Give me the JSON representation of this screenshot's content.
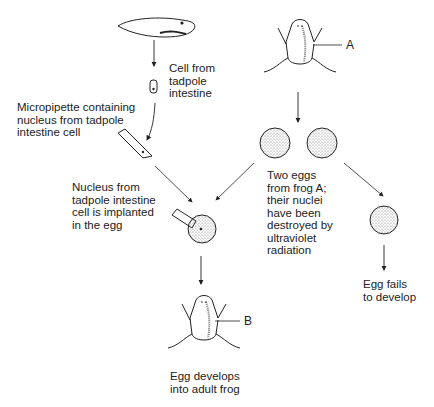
{
  "labels": {
    "cell_from_tadpole": "Cell from\ntadpole\nintestine",
    "micropipette": "Micropipette containing\nnucleus from tadpole\nintestine cell",
    "nucleus_implanted": "Nucleus from\ntadpole intestine\ncell is implanted\nin the egg",
    "two_eggs": "Two eggs\nfrom frog A;\ntheir nuclei\nhave been\ndestroyed by\nultraviolet\nradiation",
    "egg_fails": "Egg fails\nto develop",
    "egg_develops": "Egg develops\ninto adult frog",
    "frog_a": "A",
    "frog_b": "B"
  }
}
